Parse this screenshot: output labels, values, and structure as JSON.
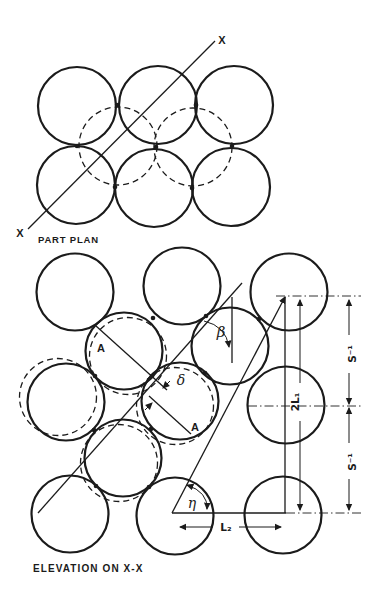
{
  "figure": {
    "background": "#ffffff",
    "ink_color": "#1b1b1b"
  },
  "part_plan": {
    "caption": "PART PLAN",
    "section_label_top": "X",
    "section_label_bottom": "X"
  },
  "elevation": {
    "caption": "ELEVATION ON X-X",
    "point_label_upper": "A",
    "point_label_lower": "A",
    "slip_gap_label": "δ",
    "angle_beta_label": "β",
    "angle_eta_label": "η",
    "dim_horizontal_label": "L₂",
    "dim_height_label": "2L₁",
    "dim_spacing_upper_label": "S⁻¹",
    "dim_spacing_lower_label": "S⁻¹"
  }
}
